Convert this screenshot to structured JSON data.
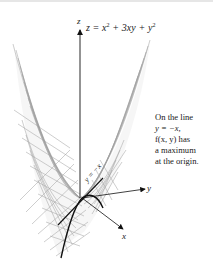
{
  "figure": {
    "equation": {
      "lhs": "z = x",
      "exp1": "2",
      "mid": " + 3xy + y",
      "exp2": "2",
      "full": "z = x² + 3xy + y²"
    },
    "axes": {
      "z_label": "z",
      "y_label": "y",
      "x_label": "x"
    },
    "line_label": "y = −x",
    "note": {
      "line1": "On the line",
      "line2": "y = −x,",
      "line3": "f(x, y) has",
      "line4": "a maximum",
      "line5": "at the origin."
    },
    "colors": {
      "mesh": "#8a8a8a",
      "axis": "#1a1a1a",
      "background": "#ffffff"
    }
  }
}
